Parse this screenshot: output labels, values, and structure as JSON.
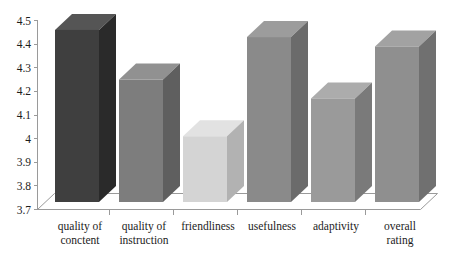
{
  "chart_data": {
    "type": "bar",
    "title": "",
    "subtitle": "",
    "xlabel": "",
    "ylabel": "",
    "ylim": [
      3.7,
      4.5
    ],
    "grid": false,
    "legend": null,
    "three_d": true,
    "categories": [
      "quality of conctent",
      "quality of instruction",
      "friendliness",
      "usefulness",
      "adaptivity",
      "overall rating"
    ],
    "category_lines": [
      [
        "quality of",
        "conctent"
      ],
      [
        "quality of",
        "instruction"
      ],
      [
        "friendliness"
      ],
      [
        "usefulness"
      ],
      [
        "adaptivity"
      ],
      [
        "overall",
        "rating"
      ]
    ],
    "values": [
      4.46,
      4.25,
      4.01,
      4.43,
      4.17,
      4.39
    ],
    "ytick_labels": [
      "4.5",
      "4.4",
      "4.3",
      "4.2",
      "4.1",
      "4",
      "3.9",
      "3.8",
      "3.7"
    ],
    "ytick_values": [
      4.5,
      4.4,
      4.3,
      4.2,
      4.1,
      4.0,
      3.9,
      3.8,
      3.7
    ],
    "bar_colors": [
      "#3f3f3f",
      "#7d7d7d",
      "#d4d4d4",
      "#8a8a8a",
      "#9a9a9a",
      "#8f8f8f"
    ],
    "bar_top_colors": [
      "#555555",
      "#919191",
      "#e2e2e2",
      "#9c9c9c",
      "#acacac",
      "#a2a2a2"
    ],
    "bar_side_colors": [
      "#2a2a2a",
      "#5f5f5f",
      "#b2b2b2",
      "#6b6b6b",
      "#7a7a7a",
      "#707070"
    ]
  },
  "axes": {
    "y_axis_name": "rating-axis",
    "x_axis_name": "category-axis"
  },
  "colors": {
    "axis": "#9a9a9a",
    "text": "#1c1c1c",
    "background": "#ffffff"
  }
}
